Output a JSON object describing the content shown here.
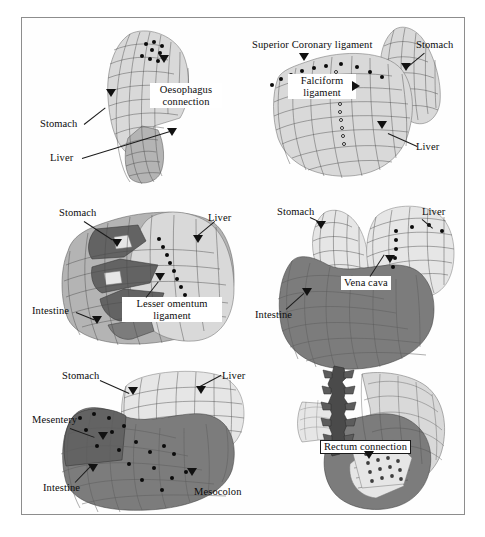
{
  "figure": {
    "border_color": "#8d8d8d",
    "background": "#ffffff"
  },
  "panels": [
    {
      "id": "panel-1",
      "name": "oesophagus-connection-view",
      "labels": [
        {
          "name": "oesophagus-connection-label",
          "text": "Oesophagus connection",
          "style": "boxed-two-line"
        },
        {
          "name": "stomach-label",
          "text": "Stomach",
          "style": "plain"
        },
        {
          "name": "liver-label",
          "text": "Liver",
          "style": "plain"
        }
      ]
    },
    {
      "id": "panel-2",
      "name": "coronary-falciform-ligament-view",
      "labels": [
        {
          "name": "superior-coronary-ligament-label",
          "text": "Superior Coronary ligament",
          "style": "plain"
        },
        {
          "name": "falciform-ligament-label",
          "text": "Falciform ligament",
          "style": "boxed-two-line"
        },
        {
          "name": "stomach-label",
          "text": "Stomach",
          "style": "plain"
        },
        {
          "name": "liver-label",
          "text": "Liver",
          "style": "plain"
        }
      ]
    },
    {
      "id": "panel-3",
      "name": "lesser-omentum-ligament-view",
      "labels": [
        {
          "name": "stomach-label",
          "text": "Stomach",
          "style": "plain"
        },
        {
          "name": "liver-label",
          "text": "Liver",
          "style": "plain"
        },
        {
          "name": "lesser-omentum-ligament-label",
          "text": "Lesser omentum ligament",
          "style": "boxed-two-line"
        },
        {
          "name": "intestine-label",
          "text": "Intestine",
          "style": "plain"
        }
      ]
    },
    {
      "id": "panel-4",
      "name": "vena-cava-view",
      "labels": [
        {
          "name": "stomach-label",
          "text": "Stomach",
          "style": "plain"
        },
        {
          "name": "liver-label",
          "text": "Liver",
          "style": "plain"
        },
        {
          "name": "vena-cava-label",
          "text": "Vena cava",
          "style": "boxed"
        },
        {
          "name": "intestine-label",
          "text": "Intestine",
          "style": "plain"
        }
      ]
    },
    {
      "id": "panel-5",
      "name": "mesentery-mesocolon-view",
      "labels": [
        {
          "name": "stomach-label",
          "text": "Stomach",
          "style": "plain"
        },
        {
          "name": "liver-label",
          "text": "Liver",
          "style": "plain"
        },
        {
          "name": "mesentery-label",
          "text": "Mesentery",
          "style": "plain"
        },
        {
          "name": "intestine-label",
          "text": "Intestine",
          "style": "plain"
        },
        {
          "name": "mesocolon-label",
          "text": "Mesocolon",
          "style": "plain"
        }
      ]
    },
    {
      "id": "panel-6",
      "name": "rectum-connection-view",
      "labels": [
        {
          "name": "rectum-connection-label",
          "text": "Rectum connection",
          "style": "boxed-outlined"
        }
      ]
    }
  ],
  "text": {
    "oesophagus_connection_l1": "Oesophagus",
    "oesophagus_connection_l2": "connection",
    "stomach": "Stomach",
    "liver": "Liver",
    "superior_coronary_ligament": "Superior Coronary ligament",
    "falciform_l1": "Falciform",
    "falciform_l2": "ligament",
    "lesser_omentum_l1": "Lesser omentum",
    "lesser_omentum_l2": "ligament",
    "intestine": "Intestine",
    "vena_cava": "Vena cava",
    "mesentery": "Mesentery",
    "mesocolon": "Mesocolon",
    "rectum_connection": "Rectum connection"
  },
  "colors": {
    "mesh_light": "#d9d9d9",
    "mesh_mid": "#b4b4b4",
    "mesh_dark": "#7c7c7c",
    "mesh_darker": "#636363",
    "mesh_pale": "#e6e6e6",
    "node_fill": "#0b0b0b",
    "node_hollow_fill": "#fbfbfb",
    "line": "#1b1b1b",
    "frame": "#8d8d8d"
  }
}
